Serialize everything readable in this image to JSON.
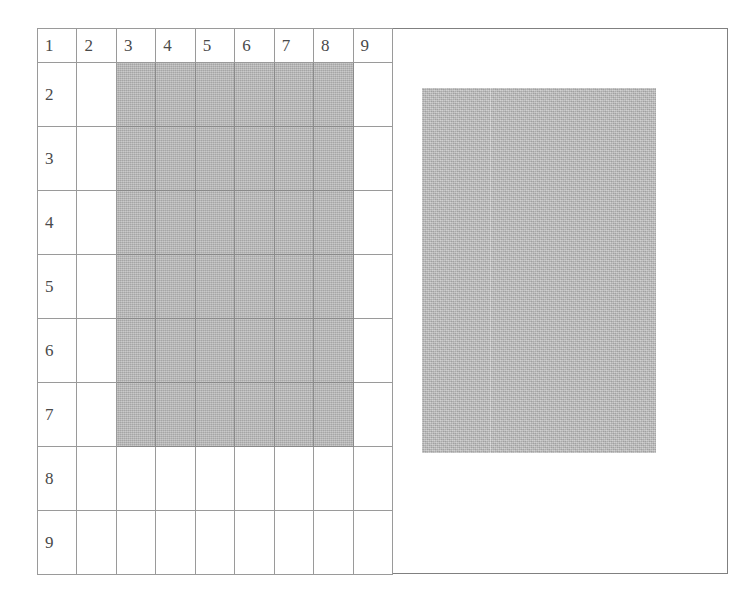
{
  "figure": {
    "frame_border_color": "#808080",
    "background_color": "#ffffff"
  },
  "grid": {
    "rows": 9,
    "columns": 9,
    "line_color": "#9a9a9a",
    "shade_color": "#b6b6b6",
    "column_headers": [
      "1",
      "2",
      "3",
      "4",
      "5",
      "6",
      "7",
      "8",
      "9"
    ],
    "row_headers": [
      "1",
      "2",
      "3",
      "4",
      "5",
      "6",
      "7",
      "8",
      "9"
    ],
    "cells": [
      [
        "1",
        "2",
        "3",
        "4",
        "5",
        "6",
        "7",
        "8",
        "9"
      ],
      [
        "2",
        "",
        "",
        "",
        "",
        "",
        "",
        "",
        ""
      ],
      [
        "3",
        "",
        "",
        "",
        "",
        "",
        "",
        "",
        ""
      ],
      [
        "4",
        "",
        "",
        "",
        "",
        "",
        "",
        "",
        ""
      ],
      [
        "5",
        "",
        "",
        "",
        "",
        "",
        "",
        "",
        ""
      ],
      [
        "6",
        "",
        "",
        "",
        "",
        "",
        "",
        "",
        ""
      ],
      [
        "7",
        "",
        "",
        "",
        "",
        "",
        "",
        "",
        ""
      ],
      [
        "8",
        "",
        "",
        "",
        "",
        "",
        "",
        "",
        ""
      ],
      [
        "9",
        "",
        "",
        "",
        "",
        "",
        "",
        "",
        ""
      ]
    ],
    "shaded_region": {
      "column_start": 3,
      "column_end": 8,
      "row_start": 2,
      "row_end": 7
    }
  },
  "gray_block": {
    "color": "#b9b9b9",
    "label": ""
  }
}
